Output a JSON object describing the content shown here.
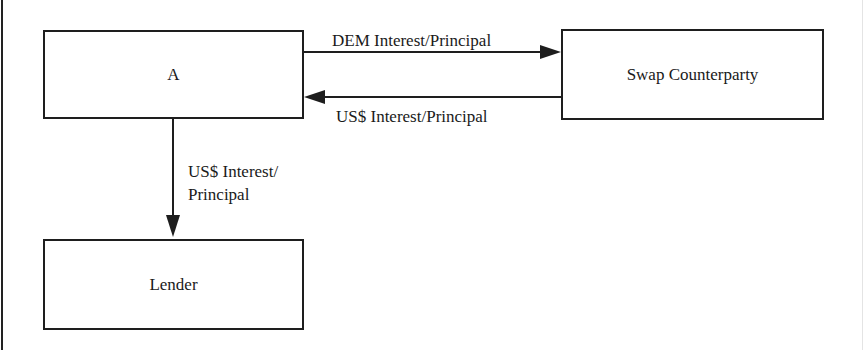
{
  "diagram": {
    "nodes": {
      "a": {
        "label": "A"
      },
      "swap_counterparty": {
        "label": "Swap Counterparty"
      },
      "lender": {
        "label": "Lender"
      }
    },
    "edges": {
      "a_to_swap": {
        "from": "A",
        "to": "Swap Counterparty",
        "label": "DEM Interest/Principal"
      },
      "swap_to_a": {
        "from": "Swap Counterparty",
        "to": "A",
        "label": "US$ Interest/Principal"
      },
      "a_to_lender": {
        "from": "A",
        "to": "Lender",
        "label_line1": "US$ Interest/",
        "label_line2": "Principal"
      }
    }
  }
}
